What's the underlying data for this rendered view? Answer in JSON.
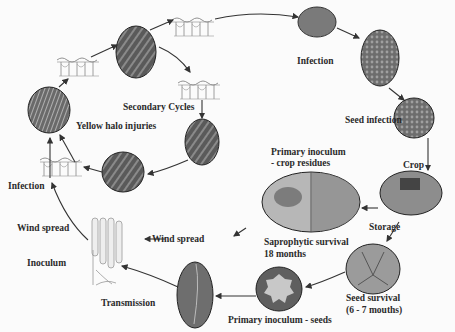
{
  "diagram": {
    "labels": {
      "infection_top": "Infection",
      "seed_infection": "Seed infection",
      "crop": "Crop",
      "primary_inoculum_residues_1": "Primary inoculum",
      "primary_inoculum_residues_2": "- crop residues",
      "storage": "Storage",
      "saprophytic_1": "Saprophytic survival",
      "saprophytic_2": "18 months",
      "seed_survival_1": "Seed survival",
      "seed_survival_2": "(6 - 7 mouths)",
      "primary_inoculum_seeds": "Primary inoculum - seeds",
      "transmission": "Transmission",
      "wind_spread_center": "Wind spread",
      "wind_spread_left": "Wind spread",
      "inoculum": "Inoculum",
      "infection_left": "Infection",
      "secondary_cycles": "Secondary Cycles",
      "yellow_halo": "Yellow halo injuries"
    },
    "nodes": [
      {
        "id": "leaf-top",
        "kind": "photo",
        "description": "leaf lesion streaks"
      },
      {
        "id": "field-infection",
        "kind": "photo",
        "description": "wheat field"
      },
      {
        "id": "ear",
        "kind": "photo",
        "description": "infected wheat ear"
      },
      {
        "id": "seeds",
        "kind": "photo",
        "description": "infected seeds"
      },
      {
        "id": "barn",
        "kind": "photo",
        "description": "storage barn"
      },
      {
        "id": "residues",
        "kind": "photo",
        "description": "crop residues"
      },
      {
        "id": "silo",
        "kind": "photo",
        "description": "seed storage interior"
      },
      {
        "id": "petri",
        "kind": "photo",
        "description": "seed culture on plate"
      },
      {
        "id": "seedling",
        "kind": "photo",
        "description": "infected seedling leaf"
      },
      {
        "id": "leaf-right",
        "kind": "photo",
        "description": "leaf lesions"
      },
      {
        "id": "leaf-bottom",
        "kind": "photo",
        "description": "leaf lesions"
      },
      {
        "id": "halo",
        "kind": "photo",
        "description": "yellow halo lesions"
      }
    ],
    "colors": {
      "background": "#fbfbfb",
      "text": "#2a2a2a",
      "arrow": "#333333"
    }
  }
}
